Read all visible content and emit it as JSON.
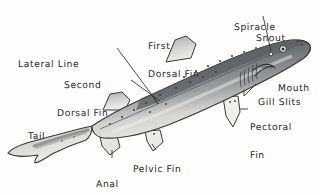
{
  "figure": {
    "style": "hand-drawn pen and ink wash illustration",
    "background_color": "#fdfdfb",
    "ink_color": "#2b2b2b",
    "dorsal_color": "#6f7377",
    "ventral_color": "#efeeea"
  },
  "labels": {
    "spiracle": "Spiracle",
    "snout": "Snout",
    "first_dorsal_fin": "First\nDorsal Fin",
    "first_dorsal_fin_line1": "First",
    "first_dorsal_fin_line2": "Dorsal Fin",
    "lateral_line": "Lateral Line",
    "second_dorsal_fin_line1": "Second",
    "second_dorsal_fin_line2": "Dorsal Fin",
    "mouth": "Mouth",
    "gill_slits": "Gill Slits",
    "pectoral_fin_line1": "Pectoral",
    "pectoral_fin_line2": "Fin",
    "tail": "Tail",
    "pelvic_fin": "Pelvic Fin",
    "anal_fin_line1": "Anal",
    "anal_fin_line2": "Fin"
  },
  "anatomy_parts": [
    "Spiracle",
    "Snout",
    "First Dorsal Fin",
    "Lateral Line",
    "Second Dorsal Fin",
    "Mouth",
    "Gill Slits",
    "Pectoral Fin",
    "Tail",
    "Pelvic Fin",
    "Anal Fin"
  ],
  "features": {
    "gill_slit_count": 5,
    "eye_count": 1,
    "spiracle_count": 1
  }
}
